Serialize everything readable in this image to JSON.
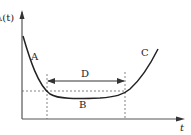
{
  "diagram": {
    "y_axis_label": "λ(t)",
    "x_axis_label": "t",
    "regions": {
      "A": "A",
      "B": "B",
      "C": "C",
      "D": "D"
    },
    "colors": {
      "curve": "#222222",
      "axis": "#555555",
      "dashed": "#555555"
    }
  }
}
